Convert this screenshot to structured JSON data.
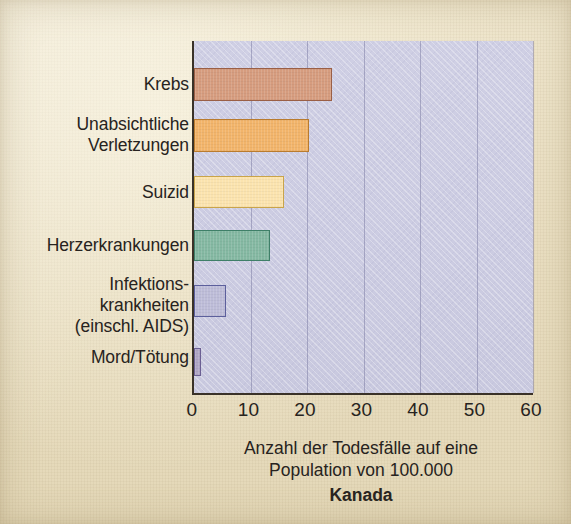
{
  "chart_data": {
    "type": "bar",
    "orientation": "horizontal",
    "title": "Kanada",
    "xlabel": "Anzahl der Todesfälle auf eine\nPopulation von 100.000",
    "ylabel": "",
    "xlim": [
      0,
      60
    ],
    "xticks": [
      0,
      10,
      20,
      30,
      40,
      50,
      60
    ],
    "xtick_labels": [
      "0",
      "10",
      "20",
      "30",
      "40",
      "50",
      "60"
    ],
    "grid": "vertical",
    "legend": "none",
    "categories": [
      "Krebs",
      "Unabsichtliche\nVerletzungen",
      "Suizid",
      "Herzerkrankungen",
      "Infektions-\nkrankheiten\n(einschl. AIDS)",
      "Mord/Tötung"
    ],
    "values": [
      24.4,
      20.4,
      16.0,
      13.5,
      5.7,
      1.3
    ],
    "bar_colors": [
      "#d69c7e",
      "#f2b46a",
      "#fbe3ae",
      "#84b8a2",
      "#bdbcd8",
      "#b0a6c6"
    ],
    "bar_edge_colors": [
      "#9a5f46",
      "#b97b2e",
      "#c9a44a",
      "#3f7f68",
      "#5c5f9c",
      "#6b5f93"
    ]
  },
  "figure": {
    "background_color": "#eadfc2",
    "plot_background_color": "#cccce2",
    "axis_color": "#3a3228",
    "gridline_color": "#8c8cb4",
    "text_color": "#272320"
  },
  "axis": {
    "title_line_1": "Anzahl der Todesfälle auf eine",
    "title_line_2": "Population von 100.000"
  },
  "country": {
    "name": "Kanada"
  },
  "categories": [
    {
      "label": "Krebs",
      "multiline": [
        "Krebs"
      ]
    },
    {
      "label": "Unabsichtliche Verletzungen",
      "multiline": [
        "Unabsichtliche",
        "Verletzungen"
      ]
    },
    {
      "label": "Suizid",
      "multiline": [
        "Suizid"
      ]
    },
    {
      "label": "Herzerkrankungen",
      "multiline": [
        "Herzerkrankungen"
      ]
    },
    {
      "label": "Infektionskrankheiten (einschl. AIDS)",
      "multiline": [
        "Infektions-",
        "krankheiten",
        "(einschl. AIDS)"
      ]
    },
    {
      "label": "Mord/Tötung",
      "multiline": [
        "Mord/Tötung"
      ]
    }
  ],
  "ticks": {
    "labels": [
      "0",
      "10",
      "20",
      "30",
      "40",
      "50",
      "60"
    ]
  }
}
